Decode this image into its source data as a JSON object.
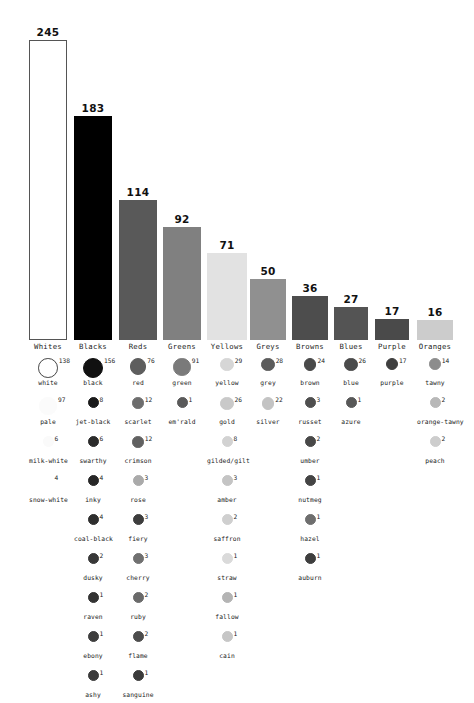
{
  "chart_data": {
    "type": "bar",
    "title": "",
    "subtitle": "",
    "xlabel": "",
    "ylabel": "",
    "grid": false,
    "legend": "none",
    "ylim": [
      0,
      245
    ],
    "categories": [
      "Whites",
      "Blacks",
      "Reds",
      "Greens",
      "Yellows",
      "Greys",
      "Browns",
      "Blues",
      "Purple",
      "Oranges"
    ],
    "values": [
      245,
      183,
      114,
      92,
      71,
      50,
      36,
      27,
      17,
      16
    ],
    "bar_colors": [
      "#ffffff",
      "#000000",
      "#595959",
      "#808080",
      "#e2e2e2",
      "#909090",
      "#4d4d4d",
      "#545454",
      "#4a4a4a",
      "#cccccc"
    ],
    "bar_border_colors": [
      "#555555",
      "#000000",
      "#595959",
      "#808080",
      "#e2e2e2",
      "#909090",
      "#4d4d4d",
      "#545454",
      "#4a4a4a",
      "#cccccc"
    ]
  },
  "dot_matrix": {
    "type": "dot-list",
    "columns": [
      {
        "category": "Whites",
        "items": [
          {
            "label": "white",
            "count": 138,
            "color": "#ffffff",
            "border": "#444444"
          },
          {
            "label": "pale",
            "count": 97,
            "color": "#fbfbfb",
            "border": "#fbfbfb"
          },
          {
            "label": "milk-white",
            "count": 6,
            "color": "#fafafa",
            "border": "#fafafa"
          },
          {
            "label": "snow-white",
            "count": 4,
            "color": "#ffffff",
            "border": "#ffffff"
          }
        ]
      },
      {
        "category": "Blacks",
        "items": [
          {
            "label": "black",
            "count": 156,
            "color": "#111111",
            "border": "#111111"
          },
          {
            "label": "jet-black",
            "count": 8,
            "color": "#1a1a1a",
            "border": "#1a1a1a"
          },
          {
            "label": "swarthy",
            "count": 6,
            "color": "#2b2b2b",
            "border": "#2b2b2b"
          },
          {
            "label": "inky",
            "count": 4,
            "color": "#272727",
            "border": "#272727"
          },
          {
            "label": "coal-black",
            "count": 4,
            "color": "#2e2e2e",
            "border": "#2e2e2e"
          },
          {
            "label": "dusky",
            "count": 2,
            "color": "#383838",
            "border": "#383838"
          },
          {
            "label": "raven",
            "count": 1,
            "color": "#333333",
            "border": "#333333"
          },
          {
            "label": "ebony",
            "count": 1,
            "color": "#3d3d3d",
            "border": "#3d3d3d"
          },
          {
            "label": "ashy",
            "count": 1,
            "color": "#3a3a3a",
            "border": "#3a3a3a"
          }
        ]
      },
      {
        "category": "Reds",
        "items": [
          {
            "label": "red",
            "count": 76,
            "color": "#5e5e5e",
            "border": "#5e5e5e"
          },
          {
            "label": "scarlet",
            "count": 12,
            "color": "#6d6d6d",
            "border": "#6d6d6d"
          },
          {
            "label": "crimson",
            "count": 12,
            "color": "#616161",
            "border": "#616161"
          },
          {
            "label": "rose",
            "count": 3,
            "color": "#aaaaaa",
            "border": "#aaaaaa"
          },
          {
            "label": "fiery",
            "count": 3,
            "color": "#3d3d3d",
            "border": "#3d3d3d"
          },
          {
            "label": "cherry",
            "count": 3,
            "color": "#707070",
            "border": "#707070"
          },
          {
            "label": "ruby",
            "count": 2,
            "color": "#6a6a6a",
            "border": "#6a6a6a"
          },
          {
            "label": "flame",
            "count": 2,
            "color": "#4c4c4c",
            "border": "#4c4c4c"
          },
          {
            "label": "sanguine",
            "count": 1,
            "color": "#3a3a3a",
            "border": "#3a3a3a"
          }
        ]
      },
      {
        "category": "Greens",
        "items": [
          {
            "label": "green",
            "count": 91,
            "color": "#7a7a7a",
            "border": "#7a7a7a"
          },
          {
            "label": "em'rald",
            "count": 1,
            "color": "#5a5a5a",
            "border": "#5a5a5a"
          }
        ]
      },
      {
        "category": "Yellows",
        "items": [
          {
            "label": "yellow",
            "count": 29,
            "color": "#d6d6d6",
            "border": "#d6d6d6"
          },
          {
            "label": "gold",
            "count": 26,
            "color": "#c9c9c9",
            "border": "#c9c9c9"
          },
          {
            "label": "gilded/gilt",
            "count": 8,
            "color": "#d2d2d2",
            "border": "#d2d2d2"
          },
          {
            "label": "amber",
            "count": 3,
            "color": "#c4c4c4",
            "border": "#c4c4c4"
          },
          {
            "label": "saffron",
            "count": 2,
            "color": "#cfcfcf",
            "border": "#cfcfcf"
          },
          {
            "label": "straw",
            "count": 1,
            "color": "#dadada",
            "border": "#dadada"
          },
          {
            "label": "fallow",
            "count": 1,
            "color": "#b4b4b4",
            "border": "#b4b4b4"
          },
          {
            "label": "cain",
            "count": 1,
            "color": "#c6c6c6",
            "border": "#c6c6c6"
          }
        ]
      },
      {
        "category": "Greys",
        "items": [
          {
            "label": "grey",
            "count": 28,
            "color": "#5c5c5c",
            "border": "#5c5c5c"
          },
          {
            "label": "silver",
            "count": 22,
            "color": "#c3c3c3",
            "border": "#c3c3c3"
          }
        ]
      },
      {
        "category": "Browns",
        "items": [
          {
            "label": "brown",
            "count": 24,
            "color": "#4a4a4a",
            "border": "#4a4a4a"
          },
          {
            "label": "russet",
            "count": 3,
            "color": "#4f4f4f",
            "border": "#4f4f4f"
          },
          {
            "label": "umber",
            "count": 2,
            "color": "#484848",
            "border": "#484848"
          },
          {
            "label": "nutmeg",
            "count": 1,
            "color": "#444444",
            "border": "#444444"
          },
          {
            "label": "hazel",
            "count": 1,
            "color": "#6e6e6e",
            "border": "#6e6e6e"
          },
          {
            "label": "auburn",
            "count": 1,
            "color": "#3e3e3e",
            "border": "#3e3e3e"
          }
        ]
      },
      {
        "category": "Blues",
        "items": [
          {
            "label": "blue",
            "count": 26,
            "color": "#4b4b4b",
            "border": "#4b4b4b"
          },
          {
            "label": "azure",
            "count": 1,
            "color": "#585858",
            "border": "#585858"
          }
        ]
      },
      {
        "category": "Purple",
        "items": [
          {
            "label": "purple",
            "count": 17,
            "color": "#3f3f3f",
            "border": "#3f3f3f"
          }
        ]
      },
      {
        "category": "Oranges",
        "items": [
          {
            "label": "tawny",
            "count": 14,
            "color": "#8c8c8c",
            "border": "#8c8c8c"
          },
          {
            "label": "orange-tawny",
            "count": 2,
            "color": "#b8b8b8",
            "border": "#b8b8b8"
          },
          {
            "label": "peach",
            "count": 2,
            "color": "#cdcdcd",
            "border": "#cdcdcd"
          }
        ]
      }
    ]
  }
}
